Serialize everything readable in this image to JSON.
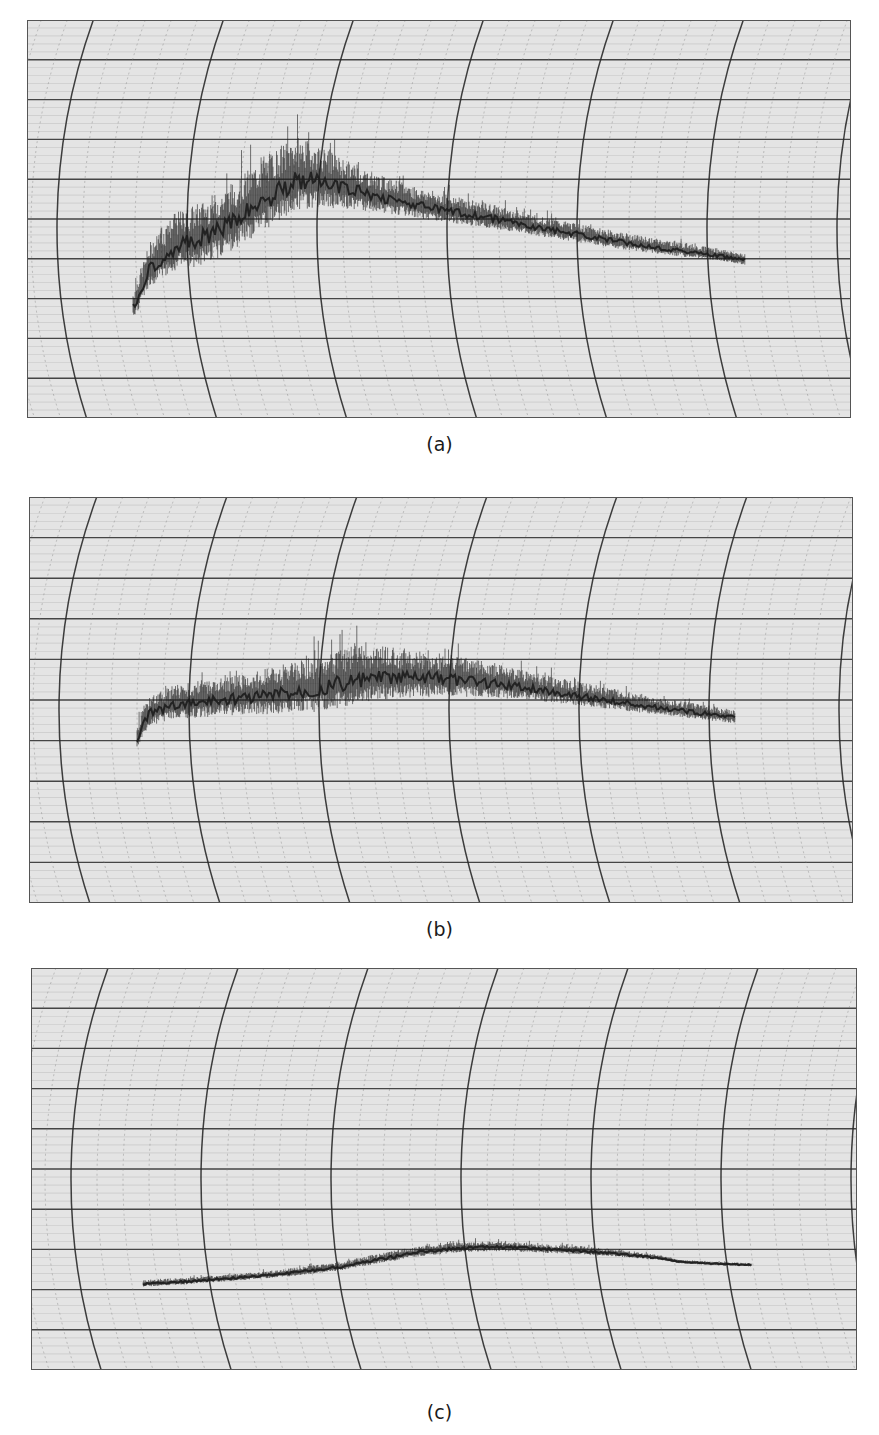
{
  "figure": {
    "panels": [
      {
        "id": "a",
        "label": "(a)",
        "box": [
          27,
          20,
          824,
          398
        ],
        "caption_y": 433
      },
      {
        "id": "b",
        "label": "(b)",
        "box": [
          29,
          497,
          824,
          406
        ],
        "caption_y": 918
      },
      {
        "id": "c",
        "label": "(c)",
        "box": [
          31,
          968,
          826,
          402
        ],
        "caption_y": 1401
      }
    ],
    "colors": {
      "paper": "#e4e4e4",
      "grid_major": "#2a2a2a",
      "grid_minor": "#7a7a7a",
      "trace": "#1c1c1c",
      "background": "#ffffff"
    }
  },
  "chart_data": [
    {
      "type": "line",
      "title": "(a)",
      "xlabel": "",
      "ylabel": "",
      "grid": true,
      "grid_style": "curvilinear strip-chart (circular arcs + horizontal lines)",
      "legend": null,
      "notes": "Very noisy trace; rises steeply from start, peaks near 1/4 of trace length, then decays linearly to end.",
      "x": [
        133,
        150,
        175,
        200,
        225,
        250,
        275,
        295,
        320,
        350,
        380,
        420,
        460,
        500,
        540,
        580,
        620,
        660,
        700,
        745
      ],
      "y_center": [
        308,
        268,
        247,
        240,
        228,
        210,
        193,
        180,
        182,
        190,
        197,
        206,
        213,
        220,
        228,
        235,
        242,
        248,
        253,
        260
      ],
      "noise_amplitude": [
        18,
        26,
        34,
        38,
        40,
        42,
        44,
        44,
        36,
        28,
        22,
        18,
        16,
        14,
        12,
        11,
        10,
        9,
        8,
        7
      ]
    },
    {
      "type": "line",
      "title": "(b)",
      "xlabel": "",
      "ylabel": "",
      "grid": true,
      "grid_style": "curvilinear strip-chart (circular arcs + horizontal lines)",
      "legend": null,
      "notes": "Noisy trace; sharp initial rise, gradual climb to broad maximum near middle, then slow decay.",
      "x": [
        137,
        150,
        175,
        200,
        240,
        280,
        320,
        350,
        380,
        420,
        460,
        500,
        540,
        580,
        620,
        660,
        700,
        735
      ],
      "y_center": [
        738,
        713,
        705,
        702,
        698,
        694,
        688,
        682,
        678,
        678,
        680,
        684,
        690,
        696,
        702,
        708,
        713,
        718
      ],
      "noise_amplitude": [
        16,
        18,
        20,
        22,
        24,
        28,
        34,
        36,
        32,
        28,
        24,
        20,
        16,
        14,
        12,
        10,
        9,
        8
      ]
    },
    {
      "type": "line",
      "title": "(c)",
      "xlabel": "",
      "ylabel": "",
      "grid": true,
      "grid_style": "curvilinear strip-chart (circular arcs + horizontal lines)",
      "legend": null,
      "notes": "Low-noise trace; nearly flat start, gentle rise to broad maximum at ~60% of length, then slight decline and step down near end.",
      "x": [
        143,
        180,
        220,
        260,
        300,
        340,
        380,
        420,
        460,
        500,
        540,
        580,
        620,
        660,
        680,
        700,
        720,
        752
      ],
      "y_center": [
        1284,
        1282,
        1279,
        1276,
        1272,
        1267,
        1259,
        1252,
        1248,
        1247,
        1249,
        1251,
        1254,
        1258,
        1262,
        1263,
        1264,
        1265
      ],
      "noise_amplitude": [
        4,
        4,
        4,
        4,
        5,
        5,
        6,
        6,
        6,
        6,
        5,
        5,
        4,
        3,
        2,
        2,
        2,
        2
      ]
    }
  ]
}
